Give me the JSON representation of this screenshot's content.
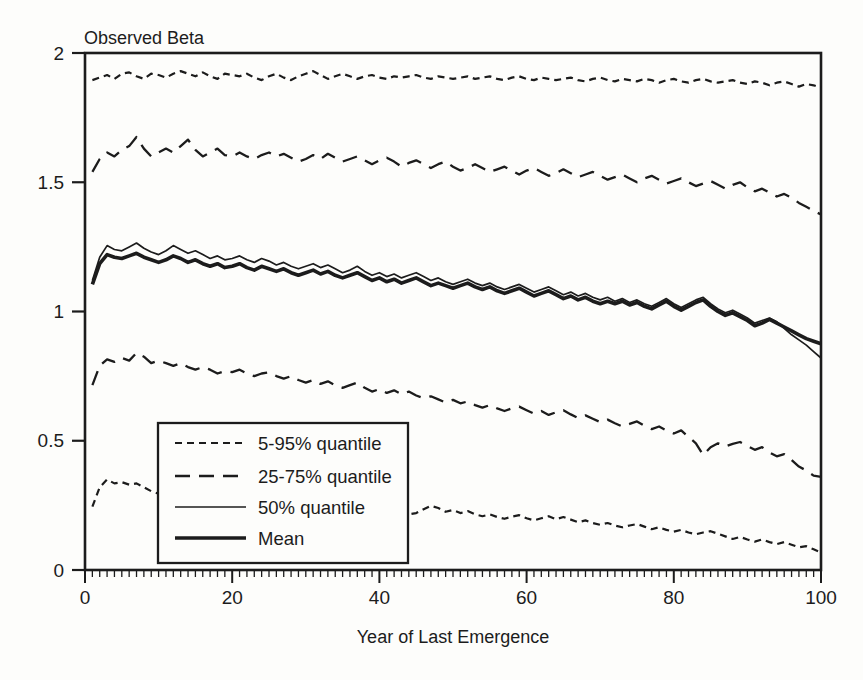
{
  "figure": {
    "background": "#fdfdfb",
    "ink_color": "#1c1c1c"
  },
  "chart_data": {
    "type": "line",
    "title": "",
    "ylabel": "Observed Beta",
    "xlabel": "Year of Last Emergence",
    "xlim": [
      0,
      100
    ],
    "ylim": [
      0,
      2
    ],
    "x_tick_values": [
      0,
      20,
      40,
      60,
      80,
      100
    ],
    "x_tick_labels": [
      "0",
      "20",
      "40",
      "60",
      "80",
      "100"
    ],
    "x_minor_tick_step": 1,
    "y_tick_values": [
      0,
      0.5,
      1,
      1.5,
      2
    ],
    "y_tick_labels": [
      "0",
      "0.5",
      "1",
      "1.5",
      "2"
    ],
    "grid": false,
    "legend_position": "inside-bottom-left",
    "legend": {
      "items": [
        {
          "label": "5-95% quantile",
          "line_style": "short-dash"
        },
        {
          "label": "25-75% quantile",
          "line_style": "long-dash"
        },
        {
          "label": "50% quantile",
          "line_style": "solid-thin"
        },
        {
          "label": "Mean",
          "line_style": "solid-thick"
        }
      ]
    },
    "x": [
      1,
      2,
      3,
      4,
      5,
      6,
      7,
      8,
      9,
      10,
      11,
      12,
      13,
      14,
      15,
      16,
      17,
      18,
      19,
      20,
      21,
      22,
      23,
      24,
      25,
      26,
      27,
      28,
      29,
      30,
      31,
      32,
      33,
      34,
      35,
      36,
      37,
      38,
      39,
      40,
      41,
      42,
      43,
      44,
      45,
      46,
      47,
      48,
      49,
      50,
      51,
      52,
      53,
      54,
      55,
      56,
      57,
      58,
      59,
      60,
      61,
      62,
      63,
      64,
      65,
      66,
      67,
      68,
      69,
      70,
      71,
      72,
      73,
      74,
      75,
      76,
      77,
      78,
      79,
      80,
      81,
      82,
      83,
      84,
      85,
      86,
      87,
      88,
      89,
      90,
      91,
      92,
      93,
      94,
      95,
      96,
      97,
      98,
      99,
      100
    ],
    "series": [
      {
        "name": "95% quantile",
        "legend": "5-95% quantile",
        "line_style": "short-dash",
        "values": [
          1.895,
          1.905,
          1.915,
          1.9,
          1.92,
          1.925,
          1.91,
          1.9,
          1.92,
          1.915,
          1.905,
          1.92,
          1.93,
          1.92,
          1.91,
          1.925,
          1.91,
          1.9,
          1.92,
          1.915,
          1.91,
          1.92,
          1.905,
          1.895,
          1.91,
          1.92,
          1.905,
          1.895,
          1.91,
          1.92,
          1.93,
          1.915,
          1.9,
          1.91,
          1.92,
          1.91,
          1.9,
          1.91,
          1.915,
          1.905,
          1.9,
          1.91,
          1.905,
          1.91,
          1.915,
          1.905,
          1.9,
          1.91,
          1.905,
          1.9,
          1.905,
          1.91,
          1.9,
          1.905,
          1.91,
          1.9,
          1.895,
          1.905,
          1.91,
          1.9,
          1.895,
          1.905,
          1.9,
          1.895,
          1.9,
          1.905,
          1.895,
          1.89,
          1.9,
          1.905,
          1.895,
          1.89,
          1.9,
          1.895,
          1.89,
          1.9,
          1.895,
          1.885,
          1.895,
          1.9,
          1.89,
          1.885,
          1.895,
          1.9,
          1.89,
          1.885,
          1.89,
          1.895,
          1.885,
          1.88,
          1.89,
          1.885,
          1.875,
          1.885,
          1.89,
          1.88,
          1.87,
          1.88,
          1.875,
          1.865
        ]
      },
      {
        "name": "75% quantile",
        "legend": "25-75% quantile",
        "line_style": "long-dash",
        "values": [
          1.54,
          1.59,
          1.615,
          1.6,
          1.625,
          1.64,
          1.675,
          1.63,
          1.6,
          1.615,
          1.63,
          1.615,
          1.64,
          1.665,
          1.625,
          1.6,
          1.615,
          1.63,
          1.605,
          1.6,
          1.615,
          1.6,
          1.59,
          1.605,
          1.615,
          1.6,
          1.61,
          1.595,
          1.58,
          1.59,
          1.605,
          1.59,
          1.61,
          1.595,
          1.58,
          1.59,
          1.6,
          1.585,
          1.57,
          1.585,
          1.595,
          1.58,
          1.56,
          1.575,
          1.585,
          1.57,
          1.555,
          1.57,
          1.58,
          1.56,
          1.545,
          1.555,
          1.57,
          1.555,
          1.54,
          1.55,
          1.56,
          1.545,
          1.53,
          1.545,
          1.555,
          1.54,
          1.525,
          1.535,
          1.55,
          1.535,
          1.52,
          1.53,
          1.54,
          1.525,
          1.51,
          1.52,
          1.53,
          1.515,
          1.5,
          1.515,
          1.525,
          1.51,
          1.495,
          1.505,
          1.515,
          1.5,
          1.485,
          1.495,
          1.505,
          1.49,
          1.475,
          1.49,
          1.5,
          1.48,
          1.465,
          1.475,
          1.46,
          1.445,
          1.455,
          1.44,
          1.42,
          1.405,
          1.39,
          1.375
        ]
      },
      {
        "name": "25% quantile",
        "legend": "25-75% quantile",
        "line_style": "long-dash",
        "values": [
          0.715,
          0.79,
          0.815,
          0.805,
          0.82,
          0.81,
          0.84,
          0.825,
          0.8,
          0.81,
          0.8,
          0.79,
          0.8,
          0.785,
          0.775,
          0.785,
          0.775,
          0.76,
          0.77,
          0.765,
          0.775,
          0.76,
          0.75,
          0.76,
          0.765,
          0.75,
          0.74,
          0.75,
          0.735,
          0.725,
          0.735,
          0.72,
          0.73,
          0.715,
          0.705,
          0.715,
          0.725,
          0.705,
          0.69,
          0.7,
          0.685,
          0.695,
          0.68,
          0.69,
          0.675,
          0.665,
          0.672,
          0.66,
          0.648,
          0.658,
          0.645,
          0.652,
          0.638,
          0.628,
          0.638,
          0.625,
          0.615,
          0.625,
          0.632,
          0.618,
          0.605,
          0.615,
          0.6,
          0.61,
          0.618,
          0.602,
          0.588,
          0.598,
          0.585,
          0.572,
          0.582,
          0.568,
          0.555,
          0.565,
          0.575,
          0.558,
          0.545,
          0.555,
          0.54,
          0.528,
          0.54,
          0.515,
          0.49,
          0.445,
          0.475,
          0.49,
          0.478,
          0.488,
          0.495,
          0.48,
          0.465,
          0.475,
          0.455,
          0.44,
          0.448,
          0.425,
          0.4,
          0.385,
          0.365,
          0.36
        ]
      },
      {
        "name": "5% quantile",
        "legend": "5-95% quantile",
        "line_style": "short-dash",
        "values": [
          0.245,
          0.32,
          0.35,
          0.335,
          0.34,
          0.33,
          0.335,
          0.32,
          0.305,
          0.295,
          0.3,
          0.29,
          0.295,
          0.285,
          0.28,
          0.285,
          0.275,
          0.27,
          0.275,
          0.268,
          0.272,
          0.262,
          0.255,
          0.262,
          0.268,
          0.256,
          0.248,
          0.255,
          0.245,
          0.24,
          0.246,
          0.238,
          0.244,
          0.235,
          0.23,
          0.236,
          0.242,
          0.232,
          0.225,
          0.23,
          0.222,
          0.228,
          0.22,
          0.215,
          0.22,
          0.235,
          0.248,
          0.24,
          0.225,
          0.232,
          0.22,
          0.228,
          0.215,
          0.208,
          0.215,
          0.205,
          0.198,
          0.206,
          0.212,
          0.2,
          0.192,
          0.2,
          0.208,
          0.196,
          0.205,
          0.195,
          0.185,
          0.192,
          0.182,
          0.175,
          0.182,
          0.172,
          0.165,
          0.172,
          0.178,
          0.168,
          0.158,
          0.165,
          0.155,
          0.148,
          0.155,
          0.145,
          0.138,
          0.145,
          0.15,
          0.14,
          0.13,
          0.12,
          0.128,
          0.118,
          0.11,
          0.118,
          0.108,
          0.1,
          0.108,
          0.098,
          0.088,
          0.092,
          0.08,
          0.068
        ]
      },
      {
        "name": "50% quantile",
        "legend": "50% quantile",
        "line_style": "solid-thin",
        "values": [
          1.12,
          1.21,
          1.255,
          1.24,
          1.235,
          1.25,
          1.265,
          1.245,
          1.23,
          1.22,
          1.235,
          1.255,
          1.24,
          1.225,
          1.235,
          1.22,
          1.205,
          1.215,
          1.2,
          1.205,
          1.215,
          1.2,
          1.19,
          1.205,
          1.195,
          1.18,
          1.19,
          1.175,
          1.165,
          1.175,
          1.185,
          1.17,
          1.18,
          1.165,
          1.15,
          1.16,
          1.175,
          1.155,
          1.14,
          1.15,
          1.135,
          1.145,
          1.13,
          1.14,
          1.15,
          1.135,
          1.12,
          1.13,
          1.115,
          1.105,
          1.115,
          1.125,
          1.11,
          1.1,
          1.11,
          1.095,
          1.085,
          1.095,
          1.105,
          1.09,
          1.075,
          1.085,
          1.095,
          1.08,
          1.065,
          1.075,
          1.06,
          1.07,
          1.055,
          1.045,
          1.055,
          1.04,
          1.05,
          1.035,
          1.045,
          1.03,
          1.02,
          1.035,
          1.05,
          1.03,
          1.015,
          1.03,
          1.045,
          1.055,
          1.03,
          1.01,
          0.995,
          1.005,
          0.99,
          0.975,
          0.955,
          0.965,
          0.975,
          0.96,
          0.935,
          0.91,
          0.89,
          0.87,
          0.845,
          0.82
        ]
      },
      {
        "name": "Mean",
        "legend": "Mean",
        "line_style": "solid-thick",
        "values": [
          1.105,
          1.185,
          1.22,
          1.21,
          1.205,
          1.215,
          1.225,
          1.21,
          1.2,
          1.19,
          1.2,
          1.215,
          1.205,
          1.19,
          1.2,
          1.185,
          1.175,
          1.185,
          1.17,
          1.175,
          1.185,
          1.17,
          1.16,
          1.175,
          1.165,
          1.155,
          1.165,
          1.15,
          1.14,
          1.15,
          1.16,
          1.145,
          1.155,
          1.14,
          1.13,
          1.14,
          1.15,
          1.135,
          1.12,
          1.13,
          1.115,
          1.125,
          1.11,
          1.12,
          1.13,
          1.115,
          1.1,
          1.11,
          1.1,
          1.09,
          1.1,
          1.11,
          1.095,
          1.085,
          1.095,
          1.08,
          1.07,
          1.08,
          1.09,
          1.075,
          1.06,
          1.07,
          1.08,
          1.065,
          1.05,
          1.06,
          1.045,
          1.055,
          1.04,
          1.03,
          1.04,
          1.03,
          1.04,
          1.025,
          1.035,
          1.02,
          1.01,
          1.025,
          1.04,
          1.02,
          1.005,
          1.02,
          1.035,
          1.045,
          1.02,
          1.0,
          0.985,
          0.995,
          0.98,
          0.965,
          0.945,
          0.955,
          0.97,
          0.955,
          0.94,
          0.925,
          0.91,
          0.895,
          0.885,
          0.875
        ]
      }
    ]
  }
}
